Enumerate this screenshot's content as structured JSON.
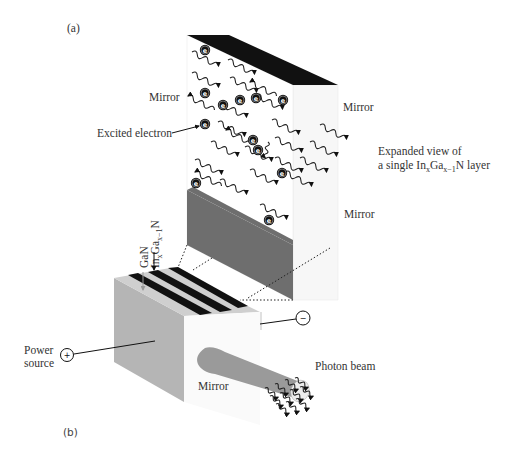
{
  "panels": {
    "a": {
      "label": "(a)"
    },
    "b": {
      "label": "(b)"
    }
  },
  "expanded_view": {
    "labels": {
      "mirror_left": "Mirror",
      "mirror_right_top": "Mirror",
      "mirror_right_bottom": "Mirror",
      "excited_electron": "Excited electron",
      "caption_line1": "Expanded view of",
      "caption_line2_prefix": "a single In",
      "caption_sub_x": "x",
      "caption_ga": "Ga",
      "caption_sub_x1": "x−1",
      "caption_line2_suffix": "N layer"
    },
    "electron_symbol": "e",
    "colors": {
      "top_mirror": "#111111",
      "bottom_mirror": "#6e6e6e",
      "face": "#ffffff",
      "side": "#f4f4f4"
    }
  },
  "device": {
    "labels": {
      "gan": "GaN",
      "ingan_prefix": "In",
      "ingan_sub_x": "x",
      "ingan_ga": "Ga",
      "ingan_sub_x1": "x−1",
      "ingan_suffix": "N",
      "power_source_line1": "Power",
      "power_source_line2": "source",
      "mirror": "Mirror",
      "photon_beam": "Photon beam"
    },
    "terminals": {
      "positive": "+",
      "negative": "−"
    },
    "colors": {
      "side_face": "#b5b5b5",
      "front_face": "#fafafa",
      "top_face": "#cfcfcf",
      "stripe": "#111111",
      "beam": "#9a9a9a"
    }
  }
}
